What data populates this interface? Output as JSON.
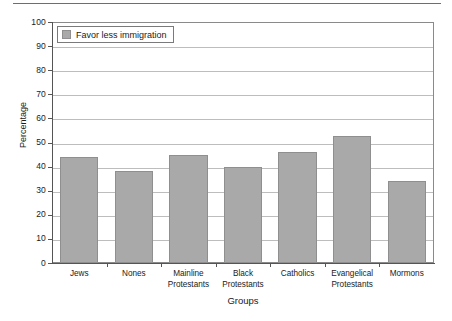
{
  "chart_data": {
    "type": "bar",
    "title": "",
    "subtitle": "",
    "xlabel": "Groups",
    "ylabel": "Percentage",
    "ylim": [
      0,
      100
    ],
    "ytick_step": 10,
    "yticks": [
      "0",
      "10",
      "20",
      "30",
      "40",
      "50",
      "60",
      "70",
      "80",
      "90",
      "100"
    ],
    "grid": "horizontal",
    "legend_position": "top-left-inside",
    "bar_color": "#a9a9a9",
    "bar_edge_color": "#8f8f8f",
    "gridline_color": "#bdbdbd",
    "axis_color": "#555555",
    "categories": [
      "Jews",
      "Mainline Protestants",
      "Black Protestants",
      "Catholics",
      "Evangelical Protestants",
      "Mormons",
      "Nones"
    ],
    "category_labels": [
      {
        "line1": "Jews",
        "line2": ""
      },
      {
        "line1": "Nones",
        "line2": ""
      },
      {
        "line1": "Mainline",
        "line2": "Protestants"
      },
      {
        "line1": "Black",
        "line2": "Protestants"
      },
      {
        "line1": "Catholics",
        "line2": ""
      },
      {
        "line1": "Evangelical",
        "line2": "Protestants"
      },
      {
        "line1": "Mormons",
        "line2": ""
      }
    ],
    "series": [
      {
        "name": "Favor less immigration",
        "values": [
          44,
          38,
          45,
          40,
          46,
          52.5,
          34
        ]
      }
    ]
  },
  "legend": {
    "label": "Favor less immigration"
  },
  "axes": {
    "y_title": "Percentage",
    "x_title": "Groups"
  }
}
